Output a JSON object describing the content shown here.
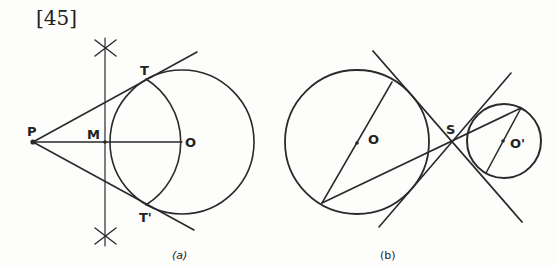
{
  "figure_number": "[45]",
  "colors": {
    "ink": "#2a2a2a",
    "paper": "#fdfdfc"
  },
  "panel_a": {
    "caption": "(a)",
    "labels": {
      "P": "P",
      "M": "M",
      "O": "O",
      "T": "T",
      "T_prime": "T'"
    },
    "points": {
      "P": [
        33,
        142
      ],
      "M": [
        105,
        142
      ],
      "O": [
        182,
        142
      ],
      "T": [
        146,
        79
      ],
      "T_prime": [
        146,
        205
      ]
    },
    "circle_O": {
      "cx": 182,
      "cy": 142,
      "r": 72
    },
    "circle_PO_diameter": {
      "cx": 107.5,
      "cy": 142,
      "r": 74.5
    },
    "perpendicular_bisector_x": 105,
    "arc_marks": [
      [
        105,
        48
      ],
      [
        105,
        236
      ]
    ],
    "tangents": [
      {
        "from": "P",
        "to": [
          197,
          52
        ]
      },
      {
        "from": "P",
        "to": [
          194,
          230
        ]
      }
    ]
  },
  "panel_b": {
    "caption": "(b)",
    "labels": {
      "O": "O",
      "O_prime": "O'",
      "S": "S"
    },
    "circle_O": {
      "cx": 357,
      "cy": 142,
      "r": 72
    },
    "circle_O_prime": {
      "cx": 504,
      "cy": 141,
      "r": 37
    },
    "S": [
      452,
      143
    ],
    "common_tangents": [
      {
        "from": [
          373,
          51
        ],
        "to": [
          522,
          222
        ]
      },
      {
        "from": [
          379,
          227
        ],
        "to": [
          511,
          73
        ]
      }
    ],
    "diameter_O": {
      "from": [
        392,
        82
      ],
      "to": [
        322,
        203
      ]
    },
    "diameter_O_prime": {
      "from": [
        521,
        108
      ],
      "to": [
        486,
        173
      ]
    },
    "secant": {
      "from": [
        322,
        203
      ],
      "to": [
        521,
        108
      ]
    }
  }
}
